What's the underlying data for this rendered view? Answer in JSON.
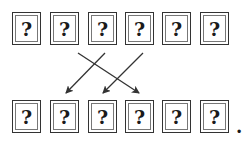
{
  "top_row": {
    "cells": [
      {
        "label": "?",
        "x": 12
      },
      {
        "label": "?",
        "x": 50
      },
      {
        "label": "?",
        "x": 88
      },
      {
        "label": "?",
        "x": 125
      },
      {
        "label": "?",
        "x": 162
      },
      {
        "label": "?",
        "x": 200
      }
    ],
    "y": 12
  },
  "bottom_row": {
    "cells": [
      {
        "label": "?",
        "x": 12
      },
      {
        "label": "?",
        "x": 50
      },
      {
        "label": "?",
        "x": 88
      },
      {
        "label": "?",
        "x": 125
      },
      {
        "label": "?",
        "x": 162
      },
      {
        "label": "?",
        "x": 200
      }
    ],
    "y": 100,
    "trailing": "."
  },
  "arrows": [
    {
      "from_cell": 2,
      "to_cell": 4,
      "x1": 78,
      "y1": 53,
      "x2": 139,
      "y2": 93
    },
    {
      "from_cell": 3,
      "to_cell": 2,
      "x1": 105,
      "y1": 53,
      "x2": 66,
      "y2": 93
    },
    {
      "from_cell": 4,
      "to_cell": 3,
      "x1": 143,
      "y1": 53,
      "x2": 103,
      "y2": 93
    }
  ],
  "colors": {
    "stroke": "#333333",
    "background": "#ffffff"
  }
}
